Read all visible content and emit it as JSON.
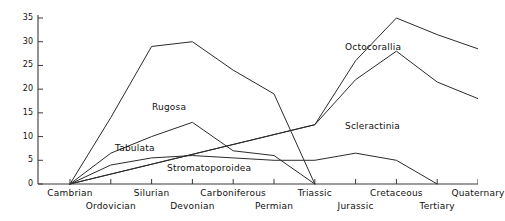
{
  "chart_data": {
    "type": "line",
    "title": "",
    "xlabel": "",
    "ylabel": "",
    "ylim": [
      0,
      35
    ],
    "yticks": [
      0,
      5,
      10,
      15,
      20,
      25,
      30,
      35
    ],
    "grid": false,
    "legend_position": "inline-annotations",
    "categories": [
      "Cambrian",
      "Ordovician",
      "Silurian",
      "Devonian",
      "Carboniferous",
      "Permian",
      "Triassic",
      "Jurassic",
      "Cretaceous",
      "Tertiary",
      "Quaternary"
    ],
    "series": [
      {
        "name": "Rugosa",
        "x": [
          "Cambrian",
          "Ordovician",
          "Silurian",
          "Devonian",
          "Carboniferous",
          "Permian",
          "Triassic"
        ],
        "values": [
          0,
          14,
          29,
          30,
          24,
          19,
          0
        ]
      },
      {
        "name": "Tabulata",
        "x": [
          "Cambrian",
          "Ordovician",
          "Silurian",
          "Devonian",
          "Carboniferous",
          "Permian",
          "Triassic"
        ],
        "values": [
          0,
          6.5,
          10,
          13,
          7,
          6,
          0
        ]
      },
      {
        "name": "Stromatoporoidea",
        "x": [
          "Cambrian",
          "Ordovician",
          "Silurian",
          "Devonian",
          "Carboniferous",
          "Permian",
          "Triassic",
          "Jurassic",
          "Cretaceous",
          "Tertiary"
        ],
        "values": [
          0,
          4,
          5.5,
          6,
          5.5,
          5,
          5,
          6.5,
          5,
          0
        ]
      },
      {
        "name": "Octocorallia",
        "x": [
          "Cambrian",
          "Triassic",
          "Jurassic",
          "Cretaceous",
          "Tertiary",
          "Quaternary"
        ],
        "values": [
          0,
          12.5,
          26,
          35,
          31.5,
          28.5
        ]
      },
      {
        "name": "Scleractinia",
        "x": [
          "Cambrian",
          "Triassic",
          "Jurassic",
          "Cretaceous",
          "Tertiary",
          "Quaternary"
        ],
        "values": [
          0,
          12.5,
          22,
          28,
          21.5,
          18
        ]
      }
    ],
    "annotations": [
      {
        "text": "Rugosa",
        "x": 152,
        "y": 102
      },
      {
        "text": "Tabulata",
        "x": 115,
        "y": 143
      },
      {
        "text": "Stromatoporoidea",
        "x": 167,
        "y": 163
      },
      {
        "text": "Octocorallia",
        "x": 345,
        "y": 42
      },
      {
        "text": "Scleractinia",
        "x": 345,
        "y": 121
      }
    ],
    "axis_label_rows": {
      "top": [
        "Cambrian",
        "Silurian",
        "Carboniferous",
        "Triassic",
        "Cretaceous",
        "Quaternary"
      ],
      "bottom": [
        "Ordovician",
        "Devonian",
        "Permian",
        "Jurassic",
        "Tertiary"
      ]
    },
    "colors": {
      "axis": "#3a3a3a",
      "line": "#2b2b2b",
      "text": "#111111",
      "background": "#ffffff"
    }
  }
}
